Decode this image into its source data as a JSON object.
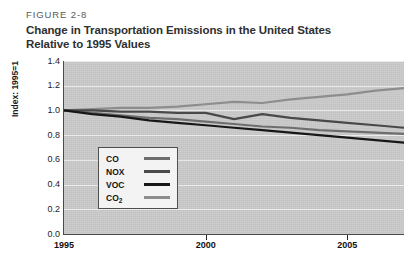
{
  "figure": {
    "number": "FIGURE 2-8",
    "title_line1": "Change in Transportation Emissions in the United States",
    "title_line2": "Relative to 1995 Values"
  },
  "chart_data": {
    "type": "line",
    "title": "Change in Transportation Emissions in the United States Relative to 1995 Values",
    "xlabel": "",
    "ylabel": "Index: 1995=1",
    "xlim": [
      1995,
      2007
    ],
    "ylim": [
      0.0,
      1.4
    ],
    "grid": true,
    "legend_position": "inside-lower-left",
    "plot_background": "#c9c9c9",
    "x_ticks": [
      1995,
      2000,
      2005
    ],
    "x_tick_labels": [
      "1995",
      "2000",
      "2005"
    ],
    "y_ticks": [
      0.0,
      0.2,
      0.4,
      0.6,
      0.8,
      1.0,
      1.2,
      1.4
    ],
    "y_tick_labels": [
      "0.0",
      "0.2",
      "0.4",
      "0.6",
      "0.8",
      "1.0",
      "1.2",
      "1.4"
    ],
    "x": [
      1995,
      1996,
      1997,
      1998,
      1999,
      2000,
      2001,
      2002,
      2003,
      2004,
      2005,
      2006,
      2007
    ],
    "series": [
      {
        "name": "CO",
        "color": "#6e6e6e",
        "values": [
          1.0,
          0.98,
          0.96,
          0.94,
          0.93,
          0.91,
          0.89,
          0.87,
          0.86,
          0.84,
          0.83,
          0.82,
          0.81
        ]
      },
      {
        "name": "NOX",
        "color": "#494949",
        "values": [
          1.0,
          1.0,
          0.99,
          0.99,
          0.98,
          0.98,
          0.93,
          0.97,
          0.94,
          0.92,
          0.9,
          0.88,
          0.86
        ]
      },
      {
        "name": "VOC",
        "color": "#171717",
        "values": [
          1.0,
          0.97,
          0.95,
          0.92,
          0.9,
          0.88,
          0.86,
          0.84,
          0.82,
          0.8,
          0.78,
          0.76,
          0.74
        ]
      },
      {
        "name": "CO2",
        "color": "#8d8d8d",
        "values": [
          1.0,
          1.01,
          1.02,
          1.02,
          1.03,
          1.05,
          1.07,
          1.06,
          1.09,
          1.11,
          1.13,
          1.16,
          1.18
        ]
      }
    ],
    "legend_entries": [
      {
        "label": "CO",
        "sub": "",
        "color": "#6e6e6e"
      },
      {
        "label": "NOX",
        "sub": "",
        "color": "#494949"
      },
      {
        "label": "VOC",
        "sub": "",
        "color": "#171717"
      },
      {
        "label": "CO",
        "sub": "2",
        "color": "#8d8d8d"
      }
    ]
  }
}
